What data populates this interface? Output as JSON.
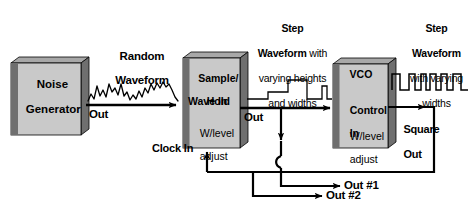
{
  "diagram": {
    "colors": {
      "box_face": "#c9c9c9",
      "box_left_edge": "#6f6f6f",
      "box_top_edge": "#a8a8a8",
      "line": "#000000",
      "background": "#ffffff"
    },
    "blocks": [
      {
        "id": "noise-generator",
        "lines": [
          "Noise",
          "Generator"
        ],
        "title_lines": [
          "Noise",
          "Generator"
        ],
        "sub_lines": []
      },
      {
        "id": "sample-hold",
        "title_lines": [
          "Sample/",
          "Hold"
        ],
        "port_in": "Wave In",
        "sub_lines": [
          "W/level",
          "adjust"
        ]
      },
      {
        "id": "vco",
        "title_lines": [
          "VCO"
        ],
        "port_in_lines": [
          "Control",
          "In"
        ],
        "sub_lines": [
          "W/level",
          "adjust"
        ]
      }
    ],
    "signal_labels": [
      {
        "id": "random-waveform",
        "lines": [
          "Random",
          "Waveform"
        ],
        "bold": [
          true,
          true
        ]
      },
      {
        "id": "step-waveform-heights-widths",
        "line1": "Step",
        "line2_bold": "Waveform",
        "line2_reg": " with",
        "line3": "varying heights",
        "line4": "and widths"
      },
      {
        "id": "step-waveform-widths",
        "line1": "Step",
        "line2": "Waveform",
        "line3": "with varying",
        "line4": "widths"
      }
    ],
    "port_labels": {
      "noise_out": "Out",
      "sample_hold_out": "Out",
      "clock_in": "Clock In",
      "square_out_line1": "Square",
      "square_out_line2": "Out"
    },
    "outputs": [
      {
        "id": "out-1",
        "label": "Out #1"
      },
      {
        "id": "out-2",
        "label": "Out #2"
      }
    ]
  }
}
